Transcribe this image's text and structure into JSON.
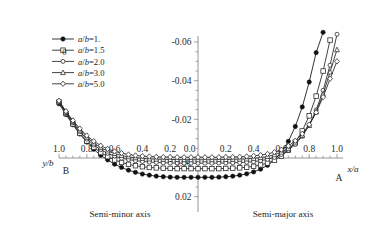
{
  "chart_data": {
    "type": "line",
    "title": "",
    "xlabel_left": "y/b",
    "xlabel_right": "x/a",
    "ylabel": "",
    "x_left_ticks": [
      "1.0",
      "0.8",
      "0.6",
      "0.4",
      "0.2",
      "0.0"
    ],
    "x_right_ticks": [
      "0.0",
      "0.2",
      "0.4",
      "0.6",
      "0.8",
      "1.0"
    ],
    "y_ticks": [
      "-0.06",
      "-0.04",
      "-0.02",
      "0.00",
      "0.02"
    ],
    "y_tick_values": [
      -0.06,
      -0.04,
      -0.02,
      0.0,
      0.02
    ],
    "ylim": [
      -0.065,
      0.025
    ],
    "xlim": [
      -1.0,
      1.0
    ],
    "grid": false,
    "legend_position": "upper-left",
    "annotations": [
      {
        "text": "B",
        "x": -1.0,
        "note": "left endpoint label"
      },
      {
        "text": "A",
        "x": 1.0,
        "note": "right endpoint label"
      },
      {
        "text": "Semi-minor axis",
        "note": "left half caption"
      },
      {
        "text": "Semi-major axis",
        "note": "right half caption"
      },
      {
        "text": "0.0",
        "note": "x origin tick"
      },
      {
        "text": "0.00",
        "note": "y origin tick"
      }
    ],
    "series": [
      {
        "name": "a/b=1.",
        "marker": "filled-circle",
        "color": "#111111",
        "x": [
          -1.0,
          -0.95,
          -0.9,
          -0.85,
          -0.8,
          -0.75,
          -0.7,
          -0.65,
          -0.6,
          -0.55,
          -0.5,
          -0.45,
          -0.4,
          -0.35,
          -0.3,
          -0.25,
          -0.2,
          -0.15,
          -0.1,
          -0.05,
          0.0,
          0.05,
          0.1,
          0.15,
          0.2,
          0.25,
          0.3,
          0.35,
          0.4,
          0.45,
          0.5,
          0.55,
          0.6,
          0.65,
          0.7,
          0.75,
          0.8,
          0.85,
          0.9
        ],
        "y": [
          -0.028,
          -0.0225,
          -0.0172,
          -0.0124,
          -0.0082,
          -0.0045,
          -0.0014,
          0.001,
          0.0032,
          0.0049,
          0.0063,
          0.0074,
          0.0083,
          0.0089,
          0.0094,
          0.0097,
          0.0099,
          0.01,
          0.01,
          0.01,
          0.01,
          0.01,
          0.01,
          0.0099,
          0.0097,
          0.0094,
          0.0089,
          0.0082,
          0.0072,
          0.0058,
          0.0038,
          0.001,
          -0.003,
          -0.0086,
          -0.0163,
          -0.0264,
          -0.0393,
          -0.0545,
          -0.065
        ]
      },
      {
        "name": "a/b=1.5",
        "marker": "open-square",
        "color": "#222222",
        "x": [
          -1.0,
          -0.95,
          -0.9,
          -0.85,
          -0.8,
          -0.75,
          -0.7,
          -0.65,
          -0.6,
          -0.55,
          -0.5,
          -0.45,
          -0.4,
          -0.35,
          -0.3,
          -0.25,
          -0.2,
          -0.15,
          -0.1,
          -0.05,
          0.0,
          0.05,
          0.1,
          0.15,
          0.2,
          0.25,
          0.3,
          0.35,
          0.4,
          0.45,
          0.5,
          0.55,
          0.6,
          0.65,
          0.7,
          0.75,
          0.8,
          0.85,
          0.9,
          0.95
        ],
        "y": [
          -0.029,
          -0.023,
          -0.0176,
          -0.0128,
          -0.0088,
          -0.0055,
          -0.0028,
          -0.0007,
          0.001,
          0.0023,
          0.0033,
          0.004,
          0.0045,
          0.0049,
          0.0051,
          0.0053,
          0.0054,
          0.0055,
          0.0055,
          0.0055,
          0.0055,
          0.0055,
          0.0055,
          0.0055,
          0.0054,
          0.0053,
          0.0051,
          0.0048,
          0.0043,
          0.0036,
          0.0026,
          0.0011,
          -0.001,
          -0.004,
          -0.0082,
          -0.014,
          -0.0218,
          -0.032,
          -0.045,
          -0.061
        ]
      },
      {
        "name": "a/b=2.0",
        "marker": "open-circle",
        "color": "#222222",
        "x": [
          -1.0,
          -0.95,
          -0.9,
          -0.85,
          -0.8,
          -0.75,
          -0.7,
          -0.65,
          -0.6,
          -0.55,
          -0.5,
          -0.45,
          -0.4,
          -0.35,
          -0.3,
          -0.25,
          -0.2,
          -0.15,
          -0.1,
          -0.05,
          0.0,
          0.05,
          0.1,
          0.15,
          0.2,
          0.25,
          0.3,
          0.35,
          0.4,
          0.45,
          0.5,
          0.55,
          0.6,
          0.65,
          0.7,
          0.75,
          0.8,
          0.85,
          0.9,
          0.95,
          1.0
        ],
        "y": [
          -0.0292,
          -0.0234,
          -0.0182,
          -0.0136,
          -0.0098,
          -0.0067,
          -0.0043,
          -0.0024,
          -0.001,
          0.0001,
          0.0008,
          0.0014,
          0.0018,
          0.0021,
          0.0023,
          0.0025,
          0.0026,
          0.0026,
          0.0027,
          0.0027,
          0.0027,
          0.0027,
          0.0027,
          0.0026,
          0.0026,
          0.0025,
          0.0024,
          0.0022,
          0.0019,
          0.0014,
          0.0007,
          -0.0003,
          -0.0018,
          -0.004,
          -0.007,
          -0.0112,
          -0.017,
          -0.0248,
          -0.035,
          -0.048,
          -0.064
        ]
      },
      {
        "name": "a/b=3.0",
        "marker": "open-triangle",
        "color": "#222222",
        "x": [
          -1.0,
          -0.95,
          -0.9,
          -0.85,
          -0.8,
          -0.75,
          -0.7,
          -0.65,
          -0.6,
          -0.55,
          -0.5,
          -0.45,
          -0.4,
          -0.35,
          -0.3,
          -0.25,
          -0.2,
          -0.15,
          -0.1,
          -0.05,
          0.0,
          0.05,
          0.1,
          0.15,
          0.2,
          0.25,
          0.3,
          0.35,
          0.4,
          0.45,
          0.5,
          0.55,
          0.6,
          0.65,
          0.7,
          0.75,
          0.8,
          0.85,
          0.9,
          0.95,
          1.0
        ],
        "y": [
          -0.0294,
          -0.0238,
          -0.0188,
          -0.0144,
          -0.0107,
          -0.0077,
          -0.0054,
          -0.0036,
          -0.0023,
          -0.0013,
          -0.0006,
          -0.0001,
          0.0002,
          0.0005,
          0.0006,
          0.0007,
          0.0008,
          0.0008,
          0.0009,
          0.0009,
          0.0009,
          0.0009,
          0.0009,
          0.0008,
          0.0008,
          0.0007,
          0.0006,
          0.0005,
          0.0002,
          -0.0002,
          -0.0008,
          -0.0017,
          -0.003,
          -0.005,
          -0.0078,
          -0.0116,
          -0.0168,
          -0.0238,
          -0.033,
          -0.0445,
          -0.056
        ]
      },
      {
        "name": "a/b=5.0",
        "marker": "open-diamond",
        "color": "#222222",
        "x": [
          -1.0,
          -0.95,
          -0.9,
          -0.85,
          -0.8,
          -0.75,
          -0.7,
          -0.65,
          -0.6,
          -0.55,
          -0.5,
          -0.45,
          -0.4,
          -0.35,
          -0.3,
          -0.25,
          -0.2,
          -0.15,
          -0.1,
          -0.05,
          0.0,
          0.05,
          0.1,
          0.15,
          0.2,
          0.25,
          0.3,
          0.35,
          0.4,
          0.45,
          0.5,
          0.55,
          0.6,
          0.65,
          0.7,
          0.75,
          0.8,
          0.85,
          0.9,
          0.95,
          1.0
        ],
        "y": [
          -0.0296,
          -0.0242,
          -0.0194,
          -0.0152,
          -0.0116,
          -0.0087,
          -0.0064,
          -0.0047,
          -0.0034,
          -0.0025,
          -0.0018,
          -0.0013,
          -0.001,
          -0.0008,
          -0.0006,
          -0.0005,
          -0.0005,
          -0.0004,
          -0.0004,
          -0.0004,
          -0.0004,
          -0.0004,
          -0.0004,
          -0.0004,
          -0.0005,
          -0.0005,
          -0.0006,
          -0.0008,
          -0.0011,
          -0.0015,
          -0.0021,
          -0.003,
          -0.0043,
          -0.0062,
          -0.0089,
          -0.0125,
          -0.0173,
          -0.0236,
          -0.0315,
          -0.041,
          -0.05
        ]
      }
    ]
  },
  "legend": {
    "items": [
      {
        "label_a": "a",
        "sep": "/",
        "label_b": "b",
        "eq": "=1."
      },
      {
        "label_a": "a",
        "sep": "/",
        "label_b": "b",
        "eq": "=1.5"
      },
      {
        "label_a": "a",
        "sep": "/",
        "label_b": "b",
        "eq": "=2.0"
      },
      {
        "label_a": "a",
        "sep": "/",
        "label_b": "b",
        "eq": "=3.0"
      },
      {
        "label_a": "a",
        "sep": "/",
        "label_b": "b",
        "eq": "=5.0"
      }
    ],
    "stray_zero": "0"
  },
  "labels": {
    "y_axis_left_name": "y/b",
    "x_axis_right_name": "x/a",
    "endpoint_left": "B",
    "endpoint_right": "A",
    "caption_left": "Semi-minor axis",
    "caption_right": "Semi-major axis",
    "origin_x": "0.0",
    "origin_y": "0.00"
  }
}
